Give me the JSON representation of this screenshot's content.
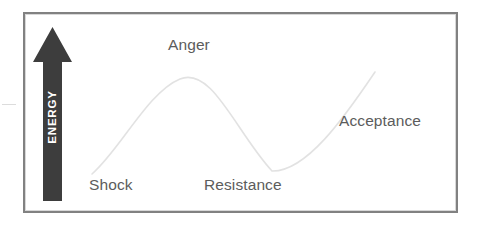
{
  "diagram": {
    "frame": {
      "border_color": "#818181",
      "background_color": "#ffffff"
    },
    "axis_arrow": {
      "name": "energy-arrow",
      "label": "ENERGY",
      "direction": "up",
      "fill_color": "#3d3d3d",
      "label_color": "#ffffff",
      "label_rotation_degrees": -90
    },
    "curve": {
      "name": "change-curve",
      "stroke_color": "#e2e2e2",
      "stroke_width": 1.6,
      "shape": "rising peak then trough then rising",
      "path": "M 92,174 C 120,150 148,92 180,79 C 212,66 236,132 272,171 C 306,172 344,118 375,72"
    },
    "labels": [
      {
        "name": "stage-label-shock",
        "text": "Shock",
        "color": "#5c5c5c"
      },
      {
        "name": "stage-label-anger",
        "text": "Anger",
        "color": "#5c5c5c"
      },
      {
        "name": "stage-label-resistance",
        "text": "Resistance",
        "color": "#5c5c5c"
      },
      {
        "name": "stage-label-acceptance",
        "text": "Acceptance",
        "color": "#5c5c5c"
      }
    ]
  },
  "chart_data": {
    "type": "line",
    "xlabel": "",
    "ylabel": "ENERGY",
    "grid": false,
    "legend": "none",
    "annotations": [
      "Shock",
      "Anger",
      "Resistance",
      "Acceptance"
    ],
    "x": [
      0,
      10,
      20,
      30,
      40,
      50,
      60,
      70,
      80,
      90,
      100
    ],
    "values": [
      5,
      28,
      55,
      78,
      92,
      80,
      48,
      18,
      8,
      30,
      72
    ],
    "stages": [
      {
        "label": "Shock",
        "x": 0,
        "y": 5
      },
      {
        "label": "Anger",
        "x": 32,
        "y": 92
      },
      {
        "label": "Resistance",
        "x": 72,
        "y": 8
      },
      {
        "label": "Acceptance",
        "x": 100,
        "y": 72
      }
    ],
    "ylim": [
      0,
      100
    ],
    "xlim": [
      0,
      100
    ]
  }
}
